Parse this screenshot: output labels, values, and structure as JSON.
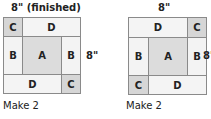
{
  "blocks": [
    {
      "top_label": "8\" (finished)",
      "side_label": "8\"",
      "caption": "Make 2",
      "cells": {
        "top_left": "C",
        "top_right": "D",
        "mid_left": "B",
        "center": "A",
        "mid_right": "B",
        "bottom_left": "D",
        "bottom_right": "C"
      }
    },
    {
      "top_label": "8\"",
      "side_label": "8\"",
      "caption": "Make 2",
      "cells": {
        "top_left": "D",
        "top_right": "C",
        "mid_left": "B",
        "center": "A",
        "mid_right": "B",
        "bottom_left": "C",
        "bottom_right": "D"
      }
    }
  ],
  "colors": {
    "A": "#dcdcdc",
    "B": "#f3f3f3",
    "C": "#d6d6d6",
    "D": "#f4f4f4",
    "border": "#8a8a8a"
  }
}
